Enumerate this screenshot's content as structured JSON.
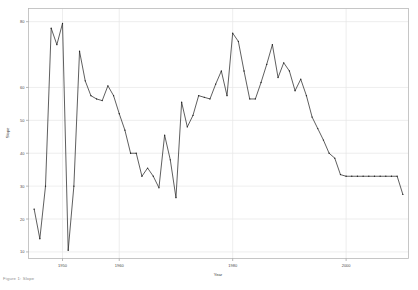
{
  "figure": {
    "background": "#ffffff",
    "frame_color": "#b9b9b9",
    "grid_color": "#e6e6e6",
    "line_color": "#2a2a2a",
    "caption": "Figure 1:  Slope"
  },
  "chart_data": {
    "type": "line",
    "title": "",
    "xlabel": "Year",
    "ylabel": "Slope",
    "grid": true,
    "legend": "none",
    "xlim": [
      1944,
      2011
    ],
    "ylim": [
      8,
      84
    ],
    "xticks": [
      1950,
      1960,
      1980,
      2000
    ],
    "xtick_labels": [
      "1950",
      "1960",
      "1980",
      "2000"
    ],
    "yticks": [
      10,
      20,
      30,
      40,
      50,
      60,
      80
    ],
    "ytick_labels": [
      "10",
      "20",
      "30",
      "40",
      "50",
      "60",
      "80"
    ],
    "marker": "point",
    "x": [
      1945,
      1946,
      1947,
      1948,
      1949,
      1950,
      1951,
      1952,
      1953,
      1954,
      1955,
      1956,
      1957,
      1958,
      1959,
      1960,
      1961,
      1962,
      1963,
      1964,
      1965,
      1966,
      1967,
      1968,
      1969,
      1970,
      1971,
      1972,
      1973,
      1974,
      1975,
      1976,
      1977,
      1978,
      1979,
      1980,
      1981,
      1982,
      1983,
      1984,
      1985,
      1986,
      1987,
      1988,
      1989,
      1990,
      1991,
      1992,
      1993,
      1994,
      1995,
      1996,
      1997,
      1998,
      1999,
      2000,
      2001,
      2002,
      2003,
      2004,
      2005,
      2006,
      2007,
      2008,
      2009,
      2010
    ],
    "values": [
      23.0,
      14.0,
      30.0,
      78.0,
      73.0,
      79.5,
      10.5,
      30.0,
      71.0,
      62.0,
      57.5,
      56.5,
      56.0,
      60.5,
      57.5,
      52.0,
      47.0,
      40.0,
      40.0,
      33.0,
      35.5,
      33.0,
      29.5,
      45.5,
      38.0,
      26.5,
      55.5,
      48.0,
      51.5,
      57.5,
      57.0,
      56.5,
      61.0,
      65.0,
      57.5,
      76.5,
      74.0,
      65.0,
      56.5,
      56.5,
      61.5,
      67.0,
      73.0,
      63.0,
      67.5,
      65.0,
      59.0,
      62.5,
      57.5,
      51.0,
      47.5,
      44.0,
      40.0,
      38.5,
      33.5,
      33.0,
      33.0,
      33.0,
      33.0,
      33.0,
      33.0,
      33.0,
      33.0,
      33.0,
      33.0,
      27.5
    ]
  }
}
